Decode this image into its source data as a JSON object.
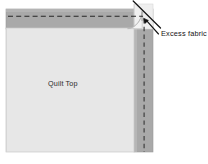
{
  "figure": {
    "kind": "quilting-instruction-diagram",
    "background_color": "#ffffff"
  },
  "labels": {
    "quilt_top": "Quilt Top",
    "excess_fabric": "Excess fabric"
  },
  "caption": {
    "text": ""
  },
  "colors": {
    "quilt_top_fill": "#e7e7e7",
    "binding_strip_fill": "#a9a9a9",
    "binding_strip_edge": "#8f8f8f",
    "corner_patch_fill": "#efefef",
    "stitch_line": "#2b2b2b",
    "outline": "#b8b8b8",
    "leader_line": "#1a1a1a",
    "arrow_head": "#111111",
    "text": "#1a1a1a"
  },
  "geometry": {
    "quilt_top": {
      "x": 6,
      "y": 28,
      "width": 128,
      "height": 124
    },
    "top_binding_strip": {
      "x": 6,
      "y": 9,
      "width": 136,
      "height": 19
    },
    "right_binding_strip": {
      "x": 134,
      "y": 9,
      "width": 19,
      "height": 143
    },
    "top_stitch_line": {
      "x1": 8,
      "y1": 16,
      "x2": 143,
      "y2": 16
    },
    "right_stitch_line": {
      "x1": 144,
      "y1": 18,
      "x2": 144,
      "y2": 152
    },
    "corner_fold_curve": "rounded tuck at top-right corner",
    "arrow_tip": {
      "x": 146,
      "y": 20
    }
  },
  "annotations": [
    {
      "name": "excess-fabric-callout",
      "label": "Excess fabric",
      "leader_lines": 2,
      "points_to": "top-right corner overlap"
    }
  ]
}
